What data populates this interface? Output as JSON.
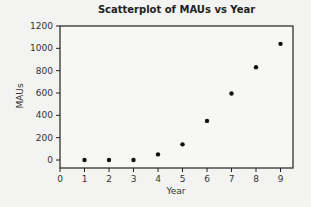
{
  "chart_data": {
    "type": "scatter",
    "title": "Scatterplot of MAUs vs Year",
    "xlabel": "Year",
    "ylabel": "MAUs",
    "x": [
      1,
      2,
      3,
      4,
      5,
      6,
      7,
      8,
      9
    ],
    "y": [
      0,
      0,
      0,
      50,
      140,
      350,
      595,
      830,
      1040
    ],
    "xlim": [
      0,
      9.5
    ],
    "ylim": [
      -70,
      1200
    ],
    "xticks": [
      0,
      1,
      2,
      3,
      4,
      5,
      6,
      7,
      8,
      9
    ],
    "yticks": [
      0,
      200,
      400,
      600,
      800,
      1000,
      1200
    ],
    "grid": false,
    "legend": null,
    "marker_color": "#111111"
  }
}
